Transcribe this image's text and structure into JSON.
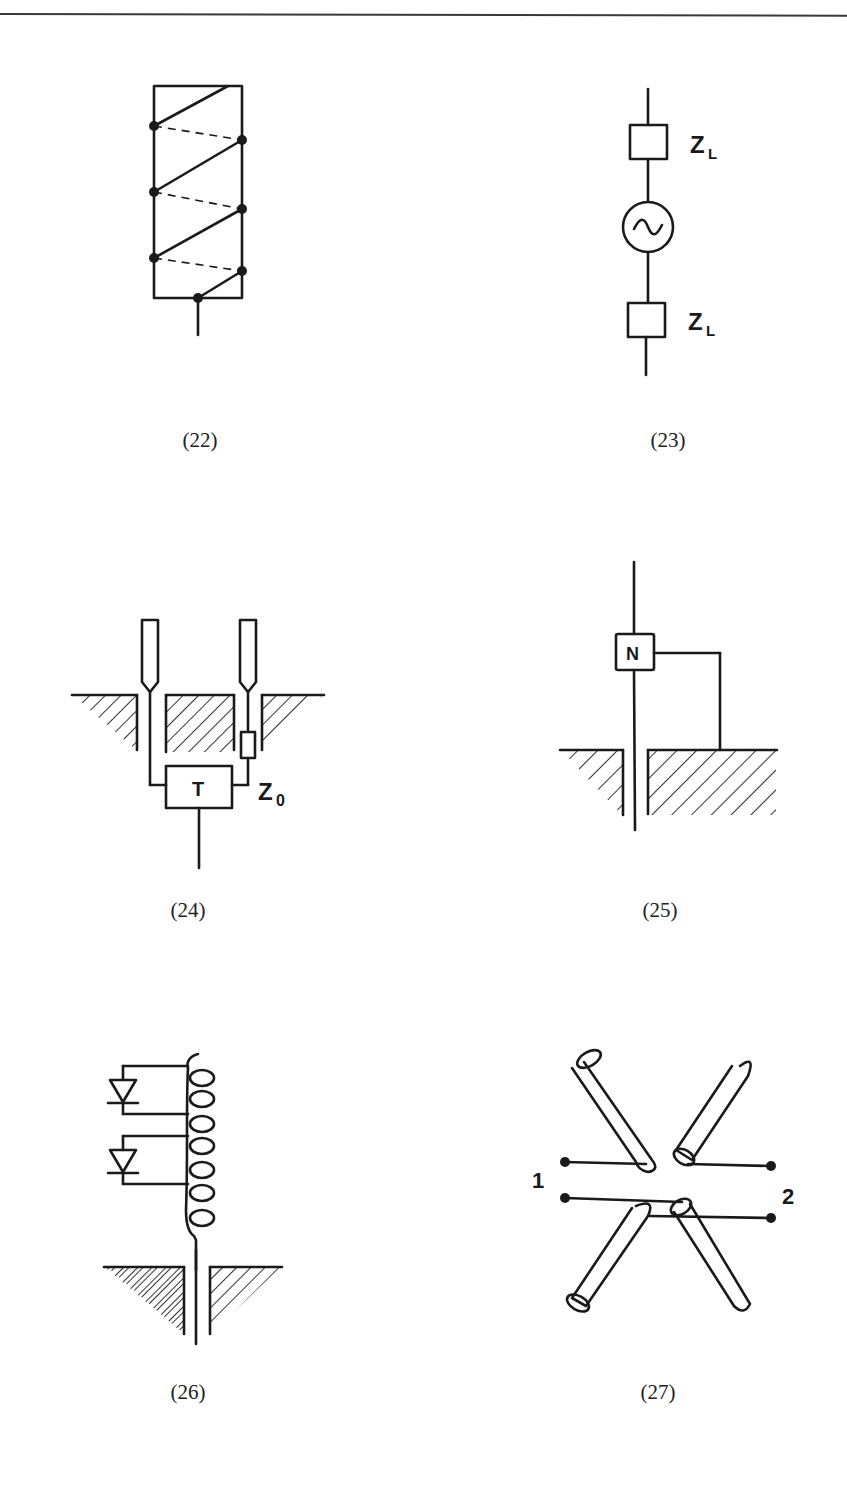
{
  "page": {
    "figures": [
      {
        "id": "22",
        "caption": "(22)",
        "description": "helical winding on rectangular former with junction dots and dashed rear traces"
      },
      {
        "id": "23",
        "caption": "(23)",
        "description": "AC source in series between two load impedances",
        "labels": {
          "top_impedance": "Z",
          "top_subscript": "L",
          "bottom_impedance": "Z",
          "bottom_subscript": "L",
          "source_symbol": "~"
        }
      },
      {
        "id": "24",
        "caption": "(24)",
        "description": "two probe elements through ground plane feeding transformer with resistive element",
        "labels": {
          "box": "T",
          "impedance": "Z",
          "impedance_subscript": "0"
        }
      },
      {
        "id": "25",
        "caption": "(25)",
        "description": "monopole through ground plane with network box connected to ground",
        "labels": {
          "box": "N"
        }
      },
      {
        "id": "26",
        "caption": "(26)",
        "description": "coil with two diode taps above ground plane"
      },
      {
        "id": "27",
        "caption": "(27)",
        "description": "crossed cylindrical dipole elements with feed terminals",
        "labels": {
          "port_1": "1",
          "port_2": "2"
        }
      }
    ]
  },
  "colors": {
    "ink": "#1a1a1a",
    "background": "#ffffff",
    "rule": "#3a3a3a"
  }
}
